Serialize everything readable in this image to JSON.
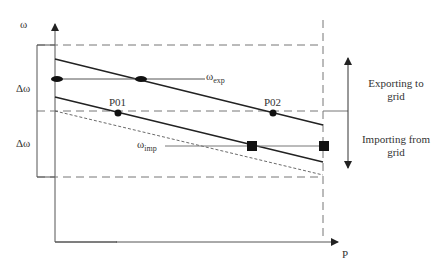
{
  "axes": {
    "y_label": "ω",
    "x_label": "P"
  },
  "labels": {
    "delta_upper": "Δω",
    "delta_lower": "Δω",
    "omega_exp_symbol": "ω",
    "omega_exp_sub": "exp",
    "omega_imp_symbol": "ω",
    "omega_imp_sub": "imp",
    "p01": "P01",
    "p02": "P02"
  },
  "annotations": {
    "export_line1": "Exporting to",
    "export_line2": "grid",
    "import_line1": "Importing from",
    "import_line2": "grid"
  },
  "colors": {
    "line": "#222222",
    "axis": "#555555",
    "dashed": "#777777"
  }
}
